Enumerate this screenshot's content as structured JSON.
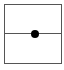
{
  "diagram": {
    "shape": "square-frame",
    "elements": [
      {
        "type": "horizontal-line",
        "position": "middle"
      },
      {
        "type": "dot",
        "position": "center-on-line"
      }
    ],
    "colors": {
      "border": "#555555",
      "line": "#555555",
      "dot": "#000000",
      "background": "#ffffff"
    }
  }
}
